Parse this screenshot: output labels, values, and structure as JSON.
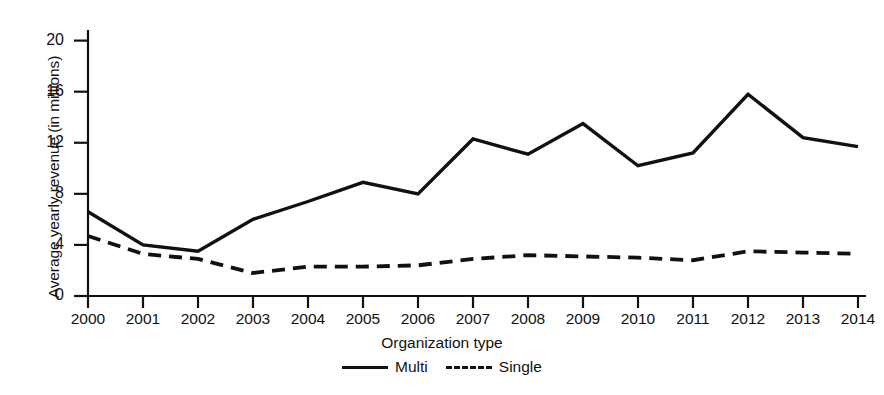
{
  "chart_data": {
    "type": "line",
    "title": "",
    "xlabel": "",
    "ylabel": "Average yearly revenue (in millions)",
    "legend_title": "Organization type",
    "legend_position": "bottom",
    "grid": false,
    "categories": [
      "2000",
      "2001",
      "2002",
      "2003",
      "2004",
      "2005",
      "2006",
      "2007",
      "2008",
      "2009",
      "2010",
      "2011",
      "2012",
      "2013",
      "2014"
    ],
    "x": [
      2000,
      2001,
      2002,
      2003,
      2004,
      2005,
      2006,
      2007,
      2008,
      2009,
      2010,
      2011,
      2012,
      2013,
      2014
    ],
    "xlim": [
      2000,
      2014
    ],
    "ylim": [
      0,
      21
    ],
    "yticks": [
      0,
      4,
      8,
      12,
      16,
      20
    ],
    "ytick_labels": [
      "0",
      "4",
      "8",
      "12",
      "16",
      "20"
    ],
    "series": [
      {
        "name": "Multi",
        "style": "solid",
        "color": "#111111",
        "values": [
          6.6,
          4.0,
          3.5,
          6.0,
          7.4,
          8.9,
          8.0,
          12.3,
          11.1,
          13.5,
          10.2,
          11.2,
          15.8,
          12.4,
          11.7
        ]
      },
      {
        "name": "Single",
        "style": "dashed",
        "color": "#111111",
        "values": [
          4.7,
          3.3,
          2.9,
          1.8,
          2.3,
          2.3,
          2.4,
          2.9,
          3.2,
          3.1,
          3.0,
          2.8,
          3.5,
          3.4,
          3.3
        ]
      }
    ]
  },
  "axis": {
    "y_title": "Average yearly revenue (in millions)",
    "y_ticks": [
      "20",
      "16",
      "12",
      "8",
      "4",
      "0"
    ],
    "x_ticks": [
      "2000",
      "2001",
      "2002",
      "2003",
      "2004",
      "2005",
      "2006",
      "2007",
      "2008",
      "2009",
      "2010",
      "2011",
      "2012",
      "2013",
      "2014"
    ]
  },
  "legend": {
    "title": "Organization type",
    "entries": [
      {
        "label": "Multi",
        "style": "solid"
      },
      {
        "label": "Single",
        "style": "dashed"
      }
    ]
  }
}
